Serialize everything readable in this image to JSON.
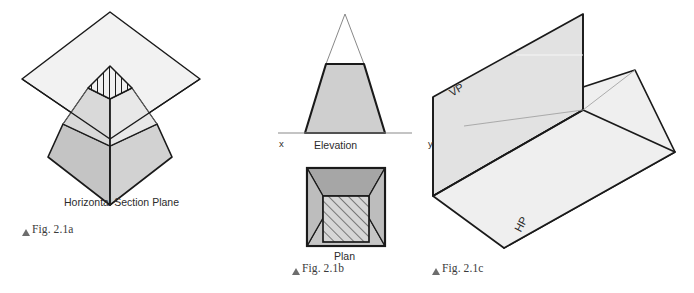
{
  "figures": {
    "a": {
      "caption": "Fig. 2.1a",
      "view_label": "Horizontal Section Plane",
      "description": "Isometric pyramid cut by a horizontal section plane showing the hatched cut section",
      "colors": {
        "section_plane_fill": "#f2f2f2",
        "upper_left_face": "#d9d9d9",
        "upper_right_face": "#ebebeb",
        "lower_left_face": "#c4c4c4",
        "lower_right_face": "#d0d0d0",
        "cut_section_fill": "#f0f0f0",
        "outline": "#1a1a1a",
        "thin_line": "#6a6a6a"
      }
    },
    "b": {
      "caption": "Fig. 2.1b",
      "elevation_label": "Elevation",
      "plan_label": "Plan",
      "axis_left_label": "x",
      "axis_right_label": "y",
      "colors": {
        "elevation_fill": "#cfcfcf",
        "apex_fill": "#ffffff",
        "plan_outer_fill": "#bdbdbd",
        "plan_top_fill": "#a6a6a6",
        "plan_inner_fill": "#d6d6d6",
        "outline": "#1a1a1a",
        "thin_line": "#7a7a7a",
        "axis_line": "#8a8a8a"
      }
    },
    "c": {
      "caption": "Fig. 2.1c",
      "vp_label": "VP",
      "hp_label": "HP",
      "description": "Two intersecting reference planes, vertical plane VP and horizontal plane HP",
      "colors": {
        "vp_fill": "#e2e2e2",
        "hp_fill": "#efefef",
        "outline": "#1a1a1a",
        "thin_line": "#8c8c8c"
      }
    }
  }
}
